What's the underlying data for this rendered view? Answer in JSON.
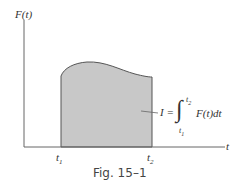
{
  "figure": {
    "y_axis_label": "F(t)",
    "x_axis_label": "t",
    "t1_label": "t",
    "t1_sub": "1",
    "t2_label": "t",
    "t2_sub": "2",
    "integral": {
      "lhs": "I =",
      "upper": "t",
      "upper_sub": "2",
      "lower": "t",
      "lower_sub": "1",
      "integrand": "F(t)dt"
    },
    "caption": "Fig. 15–1",
    "colors": {
      "fill": "#c8c8c8",
      "line": "#555555",
      "axis": "#666666"
    }
  }
}
